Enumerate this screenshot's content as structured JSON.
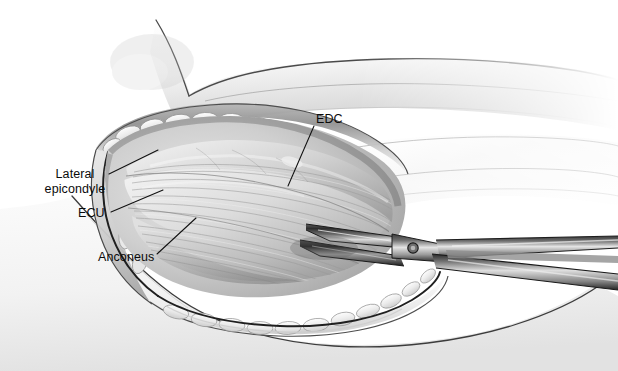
{
  "figure": {
    "width": 618,
    "height": 371,
    "background_color": "#ffffff"
  },
  "labels": [
    {
      "id": "lateral-epicondyle",
      "text": "Lateral epicondyle",
      "line1": "Lateral",
      "line2": "epicondyle"
    },
    {
      "id": "edc",
      "text": "EDC"
    },
    {
      "id": "ecu",
      "text": "ECU"
    },
    {
      "id": "anconeus",
      "text": "Anconeus"
    }
  ],
  "label_text": {
    "lateral_epicondyle": "Lateral epicondyle",
    "edc": "EDC",
    "ecu": "ECU",
    "anconeus": "Anconeus"
  },
  "caption": {
    "text": ""
  },
  "instrument": {
    "name": "surgical-scissors",
    "parts": [
      "upper-blade",
      "lower-blade",
      "pivot-screw",
      "upper-shank",
      "lower-shank"
    ]
  },
  "anatomy": {
    "structures": [
      "upper-arm-contour",
      "forearm-contour",
      "skin-edge-superior",
      "skin-edge-inferior",
      "subcutaneous-fat-lobules",
      "deep-fascia",
      "extensor-muscle-mass",
      "muscle-fiber-striations"
    ]
  },
  "colors": {
    "ink": "#2b2b2b",
    "label_text": "#0b0b0b",
    "leader_line": "#1a1a1a",
    "skin_light": "#f2f2f2",
    "skin_mid": "#d9d9d9",
    "fat_light": "#ededed",
    "muscle_light": "#d3d3d3",
    "muscle_mid": "#b4b4b4",
    "muscle_dark": "#8a8a8a",
    "wound_margin": "#262626",
    "steel_light": "#e6e6e6",
    "steel_mid": "#9a9a9a",
    "steel_dark": "#2e2e2e",
    "background": "#ffffff"
  }
}
